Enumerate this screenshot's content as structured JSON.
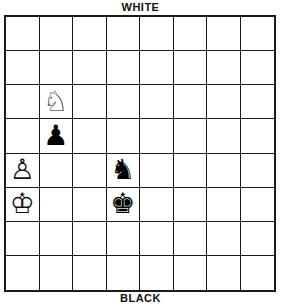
{
  "labels": {
    "top": "WHITE",
    "bottom": "BLACK"
  },
  "board": {
    "rows": 8,
    "cols": 8,
    "orientation": "white-top",
    "pieces": [
      {
        "row": 2,
        "col": 1,
        "color": "white",
        "type": "knight",
        "glyph": "♘"
      },
      {
        "row": 3,
        "col": 1,
        "color": "black",
        "type": "pawn",
        "glyph": "♟"
      },
      {
        "row": 4,
        "col": 0,
        "color": "white",
        "type": "pawn",
        "glyph": "♙"
      },
      {
        "row": 4,
        "col": 3,
        "color": "black",
        "type": "knight",
        "glyph": "♞"
      },
      {
        "row": 5,
        "col": 0,
        "color": "white",
        "type": "king",
        "glyph": "♔"
      },
      {
        "row": 5,
        "col": 3,
        "color": "black",
        "type": "king",
        "glyph": "♚"
      }
    ]
  }
}
